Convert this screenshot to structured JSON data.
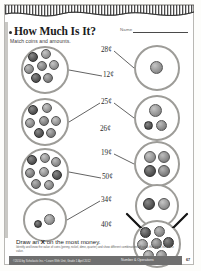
{
  "page": {
    "title": "How Much Is It?",
    "name_label": "Name",
    "instruction_top": "Match coins and amounts.",
    "instruction_bottom_pre": "Draw an ",
    "instruction_bottom_x": "X",
    "instruction_bottom_post": " on the most money.",
    "objective": "Identify and know the value of coins (penny, nickel, dime, quarter) and show different combinations of coins that equal the same value.",
    "page_number": "67"
  },
  "footer": {
    "credit": "©2010 by Scholastic Inc. • Learn With Unit, Grade 1 April 2012",
    "strand": "Number & Operations"
  },
  "amounts": [
    {
      "id": "a1",
      "label": "28¢",
      "x": 96,
      "y": 2
    },
    {
      "id": "a2",
      "label": "12¢",
      "x": 98,
      "y": 27
    },
    {
      "id": "a3",
      "label": "25¢",
      "x": 96,
      "y": 54
    },
    {
      "id": "a4",
      "label": "26¢",
      "x": 95,
      "y": 81
    },
    {
      "id": "a5",
      "label": "19¢",
      "x": 96,
      "y": 105
    },
    {
      "id": "a6",
      "label": "50¢",
      "x": 97,
      "y": 129
    },
    {
      "id": "a7",
      "label": "34¢",
      "x": 96,
      "y": 152
    },
    {
      "id": "a8",
      "label": "40¢",
      "x": 96,
      "y": 177
    }
  ],
  "left_groups": [
    {
      "id": "L1",
      "cx": 40,
      "cy": 26,
      "r": 24,
      "coins": [
        {
          "t": "penny",
          "x": -12,
          "y": -13,
          "d": 10
        },
        {
          "t": "quarter",
          "x": 1,
          "y": -16,
          "d": 10
        },
        {
          "t": "nickel",
          "x": -16,
          "y": -1,
          "d": 10
        },
        {
          "t": "dime",
          "x": -3,
          "y": -4,
          "d": 10
        },
        {
          "t": "quarter",
          "x": 9,
          "y": -5,
          "d": 10
        },
        {
          "t": "penny",
          "x": -9,
          "y": 8,
          "d": 10
        },
        {
          "t": "dime",
          "x": 3,
          "y": 8,
          "d": 10
        }
      ]
    },
    {
      "id": "L2",
      "cx": 40,
      "cy": 78,
      "r": 24,
      "coins": [
        {
          "t": "penny",
          "x": -12,
          "y": -12,
          "d": 10
        },
        {
          "t": "quarter",
          "x": 2,
          "y": -14,
          "d": 10
        },
        {
          "t": "nickel",
          "x": -15,
          "y": 1,
          "d": 10
        },
        {
          "t": "dime",
          "x": -1,
          "y": -1,
          "d": 10
        },
        {
          "t": "quarter",
          "x": 11,
          "y": -1,
          "d": 10
        },
        {
          "t": "penny",
          "x": -6,
          "y": 11,
          "d": 10
        },
        {
          "t": "dime",
          "x": 6,
          "y": 11,
          "d": 10
        }
      ]
    },
    {
      "id": "L3",
      "cx": 40,
      "cy": 128,
      "r": 24,
      "coins": [
        {
          "t": "penny",
          "x": -13,
          "y": -12,
          "d": 10
        },
        {
          "t": "quarter",
          "x": 0,
          "y": -14,
          "d": 10
        },
        {
          "t": "nickel",
          "x": 11,
          "y": -10,
          "d": 10
        },
        {
          "t": "dime",
          "x": -15,
          "y": 1,
          "d": 10
        },
        {
          "t": "quarter",
          "x": -1,
          "y": 0,
          "d": 10
        },
        {
          "t": "penny",
          "x": 12,
          "y": 3,
          "d": 10
        },
        {
          "t": "dime",
          "x": -9,
          "y": 12,
          "d": 10
        },
        {
          "t": "nickel",
          "x": 4,
          "y": 13,
          "d": 10
        }
      ]
    },
    {
      "id": "L4",
      "cx": 40,
      "cy": 176,
      "r": 22,
      "coins": [
        {
          "t": "penny",
          "x": -7,
          "y": 4,
          "d": 8
        },
        {
          "t": "quarter",
          "x": 5,
          "y": 0,
          "d": 11
        }
      ]
    }
  ],
  "right_groups": [
    {
      "id": "R1",
      "cx": 152,
      "cy": 24,
      "r": 23,
      "coins": [
        {
          "t": "quarter",
          "x": 0,
          "y": 0,
          "d": 13
        }
      ]
    },
    {
      "id": "R2",
      "cx": 152,
      "cy": 74,
      "r": 23,
      "coins": [
        {
          "t": "quarter",
          "x": -1,
          "y": -7,
          "d": 13
        },
        {
          "t": "penny",
          "x": -8,
          "y": 8,
          "d": 9
        },
        {
          "t": "nickel",
          "x": 5,
          "y": 8,
          "d": 11
        }
      ]
    },
    {
      "id": "R3",
      "cx": 152,
      "cy": 120,
      "r": 23,
      "coins": [
        {
          "t": "quarter",
          "x": -7,
          "y": -7,
          "d": 12
        },
        {
          "t": "nickel",
          "x": 7,
          "y": -7,
          "d": 12
        },
        {
          "t": "penny",
          "x": -7,
          "y": 7,
          "d": 12
        },
        {
          "t": "dime",
          "x": 7,
          "y": 7,
          "d": 12
        }
      ]
    },
    {
      "id": "R4",
      "cx": 152,
      "cy": 162,
      "r": 22,
      "coins": [
        {
          "t": "penny",
          "x": -8,
          "y": -2,
          "d": 12
        },
        {
          "t": "quarter",
          "x": 7,
          "y": -2,
          "d": 12
        }
      ]
    },
    {
      "id": "R5",
      "cx": 152,
      "cy": 200,
      "r": 24,
      "coins": [
        {
          "t": "penny",
          "x": -11,
          "y": -11,
          "d": 11
        },
        {
          "t": "nickel",
          "x": 3,
          "y": -12,
          "d": 11
        },
        {
          "t": "quarter",
          "x": -14,
          "y": 1,
          "d": 11
        },
        {
          "t": "dime",
          "x": 0,
          "y": 0,
          "d": 11
        },
        {
          "t": "penny",
          "x": 12,
          "y": -1,
          "d": 11
        },
        {
          "t": "quarter",
          "x": -8,
          "y": 12,
          "d": 11
        },
        {
          "t": "nickel",
          "x": 5,
          "y": 12,
          "d": 11
        }
      ]
    }
  ],
  "connections": [
    {
      "from": "L1",
      "to": "a2"
    },
    {
      "from": "a1",
      "to": "R1"
    },
    {
      "from": "L2",
      "to": "a3"
    },
    {
      "from": "a3",
      "to": "R2"
    },
    {
      "from": "L3",
      "to": "a6"
    },
    {
      "from": "a5",
      "to": "R3"
    },
    {
      "from": "L4",
      "to": "a7"
    }
  ],
  "marked_group": "R5"
}
